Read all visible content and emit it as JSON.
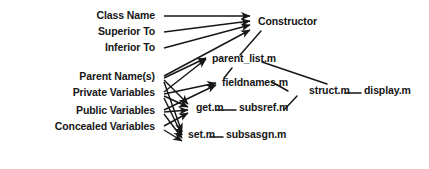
{
  "diagram": {
    "type": "directed-graph",
    "background_color": "#ffffff",
    "ink_color": "#161616",
    "inputs": [
      {
        "id": "class_name",
        "label": "Class Name",
        "x": 155,
        "y": 18
      },
      {
        "id": "superior_to",
        "label": "Superior To",
        "x": 155,
        "y": 34
      },
      {
        "id": "inferior_to",
        "label": "Inferior To",
        "x": 155,
        "y": 50
      },
      {
        "id": "parent_names",
        "label": "Parent Name(s)",
        "x": 155,
        "y": 79
      },
      {
        "id": "private_variables",
        "label": "Private Variables",
        "x": 155,
        "y": 95
      },
      {
        "id": "public_variables",
        "label": "Public Variables",
        "x": 155,
        "y": 113
      },
      {
        "id": "concealed_variables",
        "label": "Concealed Variables",
        "x": 155,
        "y": 129
      }
    ],
    "files": [
      {
        "id": "constructor",
        "label": "Constructor",
        "x": 258,
        "y": 24
      },
      {
        "id": "parent_list_m",
        "label": "parent_list.m",
        "x": 212,
        "y": 61
      },
      {
        "id": "fieldnames_m",
        "label": "fieldnames.m",
        "x": 222,
        "y": 85
      },
      {
        "id": "get_m",
        "label": "get.m",
        "x": 196,
        "y": 110
      },
      {
        "id": "subsref_m",
        "label": "subsref.m",
        "x": 239,
        "y": 110
      },
      {
        "id": "struct_m",
        "label": "struct.m",
        "x": 309,
        "y": 93
      },
      {
        "id": "display_m",
        "label": "display.m",
        "x": 364,
        "y": 93
      },
      {
        "id": "set_m",
        "label": "set.m",
        "x": 188,
        "y": 137
      },
      {
        "id": "subsasgn_m",
        "label": "subsasgn.m",
        "x": 226,
        "y": 137
      }
    ],
    "arrows": [
      {
        "from": "class_name",
        "to": "constructor",
        "x1": 164,
        "y1": 16,
        "x2": 250,
        "y2": 16
      },
      {
        "from": "superior_to",
        "to": "constructor",
        "x1": 164,
        "y1": 32,
        "x2": 250,
        "y2": 21
      },
      {
        "from": "inferior_to",
        "to": "constructor",
        "x1": 164,
        "y1": 48,
        "x2": 250,
        "y2": 25
      },
      {
        "from": "parent_names",
        "to": "constructor",
        "x1": 164,
        "y1": 76,
        "x2": 250,
        "y2": 30
      },
      {
        "from": "parent_names",
        "to": "parent_list_m",
        "x1": 164,
        "y1": 78,
        "x2": 206,
        "y2": 58
      },
      {
        "from": "parent_names",
        "to": "get_m",
        "x1": 164,
        "y1": 80,
        "x2": 188,
        "y2": 104
      },
      {
        "from": "parent_names",
        "to": "set_m",
        "x1": 164,
        "y1": 82,
        "x2": 182,
        "y2": 132
      },
      {
        "from": "private_variables",
        "to": "parent_list_m",
        "x1": 164,
        "y1": 92,
        "x2": 206,
        "y2": 59
      },
      {
        "from": "private_variables",
        "to": "fieldnames_m",
        "x1": 164,
        "y1": 94,
        "x2": 216,
        "y2": 83
      },
      {
        "from": "private_variables",
        "to": "get_m",
        "x1": 164,
        "y1": 96,
        "x2": 188,
        "y2": 107
      },
      {
        "from": "private_variables",
        "to": "set_m",
        "x1": 164,
        "y1": 98,
        "x2": 182,
        "y2": 135
      },
      {
        "from": "public_variables",
        "to": "fieldnames_m",
        "x1": 164,
        "y1": 110,
        "x2": 216,
        "y2": 85
      },
      {
        "from": "public_variables",
        "to": "get_m",
        "x1": 164,
        "y1": 112,
        "x2": 188,
        "y2": 110
      },
      {
        "from": "public_variables",
        "to": "set_m",
        "x1": 164,
        "y1": 114,
        "x2": 182,
        "y2": 138
      },
      {
        "from": "concealed_variables",
        "to": "get_m",
        "x1": 164,
        "y1": 126,
        "x2": 188,
        "y2": 113
      },
      {
        "from": "concealed_variables",
        "to": "set_m",
        "x1": 164,
        "y1": 130,
        "x2": 182,
        "y2": 141
      }
    ],
    "links": [
      {
        "from": "constructor",
        "to": "parent_list_m",
        "x1": 261,
        "y1": 31,
        "x2": 240,
        "y2": 55
      },
      {
        "from": "parent_list_m",
        "to": "fieldnames_m",
        "x1": 232,
        "y1": 68,
        "x2": 224,
        "y2": 78
      },
      {
        "from": "parent_list_m",
        "to": "struct_m",
        "x1": 262,
        "y1": 62,
        "x2": 327,
        "y2": 84
      },
      {
        "from": "fieldnames_m",
        "to": "struct_m",
        "x1": 272,
        "y1": 82,
        "x2": 288,
        "y2": 91
      },
      {
        "from": "subsref_m",
        "to": "struct_m",
        "x1": 284,
        "y1": 110,
        "x2": 297,
        "y2": 96
      },
      {
        "from": "get_m",
        "to": "subsref_m",
        "x1": 216,
        "y1": 110,
        "x2": 236,
        "y2": 110
      },
      {
        "from": "set_m",
        "to": "subsasgn_m",
        "x1": 210,
        "y1": 137,
        "x2": 223,
        "y2": 137
      },
      {
        "from": "struct_m",
        "to": "display_m",
        "x1": 345,
        "y1": 93,
        "x2": 361,
        "y2": 93
      }
    ]
  }
}
